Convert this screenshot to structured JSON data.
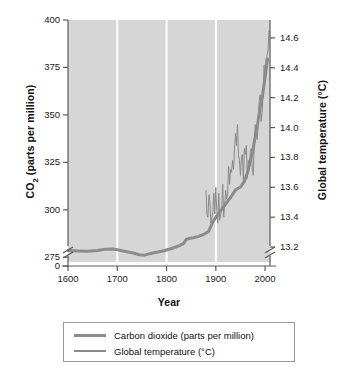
{
  "chart_data": {
    "type": "line",
    "title": "",
    "xlabel": "Year",
    "ylabel": "CO2 (parts per million)",
    "ylabel_right": "Global temperature (°C)",
    "xlim": [
      1600,
      2010
    ],
    "ylim": [
      272.5,
      400
    ],
    "ylim_right": [
      13.1,
      14.72
    ],
    "grid": "vertical-white-gridlines-at-1700-1800-1900",
    "axis_break": "both y-axes broken below lowest tick (275 ppm / 13.2 C), with 0 shown at left axis base",
    "legend_position": "below-plot-boxed",
    "xticks": [
      1600,
      1700,
      1800,
      1900,
      2000
    ],
    "yticks_left": [
      275,
      300,
      325,
      350,
      375,
      400
    ],
    "ytick_zero_left": 0,
    "yticks_right": [
      13.2,
      13.4,
      13.6,
      13.8,
      14.0,
      14.2,
      14.4,
      14.6
    ],
    "series": [
      {
        "name": "Carbon dioxide (parts per million)",
        "axis": "left",
        "units": "ppm",
        "color": "#8c8c8c",
        "linewidth": 3,
        "x": [
          1600,
          1620,
          1640,
          1660,
          1675,
          1690,
          1700,
          1715,
          1730,
          1745,
          1755,
          1765,
          1780,
          1795,
          1810,
          1825,
          1835,
          1840,
          1848,
          1855,
          1865,
          1875,
          1885,
          1895,
          1900,
          1910,
          1920,
          1930,
          1940,
          1950,
          1958,
          1965,
          1970,
          1975,
          1980,
          1985,
          1990,
          1995,
          2000,
          2005
        ],
        "values": [
          278.5,
          278.3,
          278.2,
          278.6,
          279.2,
          279.3,
          279.0,
          278.2,
          277.4,
          276.3,
          276.1,
          276.8,
          277.6,
          278.4,
          279.6,
          281.0,
          282.3,
          284.5,
          285.0,
          285.3,
          286.0,
          287.0,
          288.5,
          294.0,
          296.0,
          299.5,
          303.0,
          306.5,
          310.5,
          312.0,
          315.0,
          320.0,
          325.5,
          331.0,
          338.5,
          345.5,
          354.0,
          360.5,
          369.5,
          379.5
        ]
      },
      {
        "name": "Global temperature (°C)",
        "axis": "right",
        "units": "°C",
        "color": "#8a8a8a",
        "linewidth": 1,
        "x": [
          1880,
          1882,
          1884,
          1886,
          1888,
          1890,
          1892,
          1894,
          1896,
          1898,
          1900,
          1902,
          1904,
          1906,
          1908,
          1910,
          1912,
          1914,
          1916,
          1918,
          1920,
          1922,
          1924,
          1926,
          1928,
          1930,
          1932,
          1934,
          1936,
          1938,
          1940,
          1942,
          1944,
          1946,
          1948,
          1950,
          1952,
          1954,
          1956,
          1958,
          1960,
          1962,
          1964,
          1966,
          1968,
          1970,
          1972,
          1974,
          1976,
          1978,
          1980,
          1982,
          1984,
          1986,
          1988,
          1990,
          1992,
          1994,
          1996,
          1998,
          2000,
          2002,
          2004,
          2006,
          2008
        ],
        "values": [
          13.58,
          13.42,
          13.4,
          13.55,
          13.5,
          13.36,
          13.4,
          13.44,
          13.56,
          13.42,
          13.6,
          13.44,
          13.36,
          13.56,
          13.38,
          13.42,
          13.46,
          13.62,
          13.4,
          13.48,
          13.58,
          13.52,
          13.56,
          13.74,
          13.62,
          13.72,
          13.7,
          13.78,
          13.72,
          13.86,
          13.96,
          13.88,
          14.02,
          13.82,
          13.78,
          13.68,
          13.8,
          13.82,
          13.64,
          13.86,
          13.82,
          13.88,
          13.66,
          13.78,
          13.72,
          13.84,
          13.86,
          13.72,
          13.68,
          13.88,
          14.02,
          13.96,
          13.92,
          14.02,
          14.18,
          14.22,
          14.04,
          14.1,
          14.22,
          14.42,
          14.34,
          14.46,
          14.48,
          14.52,
          14.65
        ]
      }
    ]
  },
  "axes": {
    "left_title": "CO",
    "left_title_sub": "2",
    "left_title_rest": " (parts per million)",
    "right_title": "Global temperature (°C)",
    "x_title": "Year"
  },
  "ticks": {
    "left": [
      "400",
      "375",
      "350",
      "325",
      "300",
      "275",
      "0"
    ],
    "right": [
      "14.6",
      "14.4",
      "14.2",
      "14.0",
      "13.8",
      "13.6",
      "13.4",
      "13.2"
    ],
    "bottom": [
      "1600",
      "1700",
      "1800",
      "1900",
      "2000"
    ]
  },
  "legend": {
    "items": [
      {
        "label": "Carbon dioxide (parts per million)",
        "color": "#8c8c8c"
      },
      {
        "label": "Global temperature (°C)",
        "color": "#8a8a8a"
      }
    ]
  },
  "colors": {
    "plot_background": "#d6d6d6",
    "gridline": "#ffffff",
    "axis": "#5a5a5a",
    "co2_line": "#8c8c8c",
    "temperature_line": "#8a8a8a",
    "page_background": "#ffffff"
  }
}
